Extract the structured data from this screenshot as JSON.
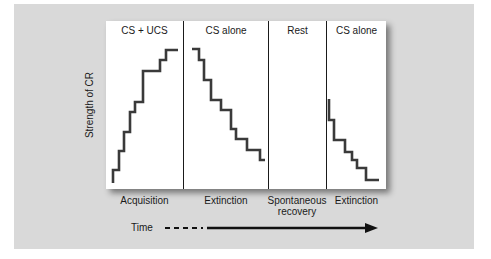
{
  "chart_data": {
    "type": "line",
    "title": "",
    "xlabel": "Time",
    "ylabel": "Strength of CR",
    "grid": false,
    "phases": [
      {
        "title": "CS + UCS",
        "label": "Acquisition"
      },
      {
        "title": "CS alone",
        "label": "Extinction"
      },
      {
        "title": "Rest",
        "label": "Spontaneous recovery"
      },
      {
        "title": "CS alone",
        "label": "Extinction"
      }
    ],
    "series": [
      {
        "name": "Acquisition",
        "style": "step",
        "points": [
          [
            113,
            183
          ],
          [
            113,
            170
          ],
          [
            119,
            170
          ],
          [
            119,
            151
          ],
          [
            124,
            151
          ],
          [
            124,
            132
          ],
          [
            130,
            132
          ],
          [
            130,
            112
          ],
          [
            135,
            112
          ],
          [
            135,
            102
          ],
          [
            143,
            102
          ],
          [
            143,
            71
          ],
          [
            160,
            71
          ],
          [
            160,
            60
          ],
          [
            166,
            60
          ],
          [
            166,
            50
          ],
          [
            178,
            50
          ]
        ]
      },
      {
        "name": "Extinction",
        "style": "step",
        "points": [
          [
            192,
            49
          ],
          [
            199,
            49
          ],
          [
            199,
            60
          ],
          [
            204,
            60
          ],
          [
            204,
            80
          ],
          [
            211,
            80
          ],
          [
            211,
            100
          ],
          [
            221,
            100
          ],
          [
            221,
            110
          ],
          [
            231,
            110
          ],
          [
            231,
            129
          ],
          [
            236,
            129
          ],
          [
            236,
            139
          ],
          [
            247,
            139
          ],
          [
            247,
            150
          ],
          [
            260,
            150
          ],
          [
            260,
            160
          ],
          [
            265,
            160
          ]
        ]
      },
      {
        "name": "Extinction after spontaneous recovery",
        "style": "step",
        "points": [
          [
            329,
            99
          ],
          [
            329,
            120
          ],
          [
            334,
            120
          ],
          [
            334,
            140
          ],
          [
            345,
            140
          ],
          [
            345,
            152
          ],
          [
            352,
            152
          ],
          [
            352,
            160
          ],
          [
            357,
            160
          ],
          [
            357,
            168
          ],
          [
            366,
            168
          ],
          [
            366,
            180
          ],
          [
            379,
            180
          ]
        ]
      }
    ],
    "time_axis": {
      "dashed_from": 165,
      "dashed_to": 203,
      "solid_from": 207,
      "arrow_tip": 378,
      "y": 228
    }
  },
  "labels": {
    "ylabel": "Strength of CR",
    "time": "Time",
    "phase_titles": [
      "CS + UCS",
      "CS alone",
      "Rest",
      "CS alone"
    ],
    "phase_labels": [
      "Acquisition",
      "Extinction",
      "Spontaneous recovery",
      "Extinction"
    ]
  },
  "colors": {
    "background": "#d9d9d9",
    "panel": "#ffffff",
    "line": "#3a3a3a",
    "text": "#1a1a1a"
  }
}
